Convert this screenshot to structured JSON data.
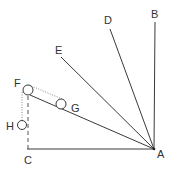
{
  "diagram": {
    "labels": {
      "A": "A",
      "B": "B",
      "C": "C",
      "D": "D",
      "E": "E",
      "F": "F",
      "G": "G",
      "H": "H"
    },
    "colors": {
      "line": "#3a3a3a",
      "dotted": "#888888",
      "text": "#333333"
    }
  }
}
